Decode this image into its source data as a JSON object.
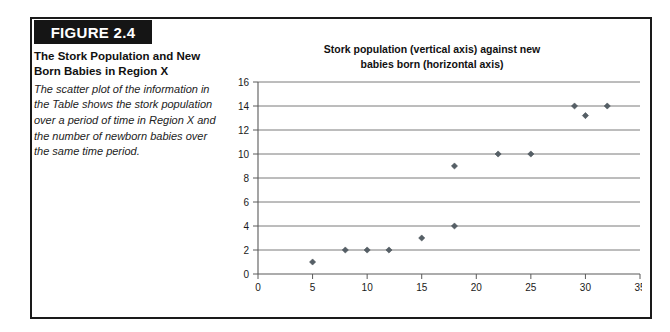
{
  "figure": {
    "badge_label": "FIGURE 2.4",
    "caption_title": "The Stork Population and New Born Babies in Region X",
    "caption_body": "The scatter plot of the information in the Table shows the stork population over a period of time in Region X and the number of newborn babies over the same time period."
  },
  "colors": {
    "frame": "#1a1a1a",
    "badge_bg": "#151515",
    "badge_text": "#ffffff",
    "marker": "#555f66",
    "gridline": "#6b6b6b",
    "axis": "#5a5a5a"
  },
  "chart_data": {
    "type": "scatter",
    "title": "Stork population (vertical axis) against new babies born (horizontal axis)",
    "title_line_1": "Stork population (vertical axis) against new",
    "title_line_2": "babies born (horizontal axis)",
    "xlabel": "",
    "ylabel": "",
    "xlim": [
      0,
      35
    ],
    "ylim": [
      0,
      16
    ],
    "xticks": [
      0,
      5,
      10,
      15,
      20,
      25,
      30,
      35
    ],
    "yticks": [
      0,
      2,
      4,
      6,
      8,
      10,
      12,
      14,
      16
    ],
    "grid": "horizontal",
    "legend": "none",
    "series": [
      {
        "name": "Stork population vs new babies born",
        "points": [
          {
            "x": 5,
            "y": 1
          },
          {
            "x": 8,
            "y": 2
          },
          {
            "x": 10,
            "y": 2
          },
          {
            "x": 12,
            "y": 2
          },
          {
            "x": 15,
            "y": 3
          },
          {
            "x": 18,
            "y": 4
          },
          {
            "x": 18,
            "y": 9
          },
          {
            "x": 22,
            "y": 10
          },
          {
            "x": 25,
            "y": 10
          },
          {
            "x": 29,
            "y": 14
          },
          {
            "x": 30,
            "y": 13.2
          },
          {
            "x": 32,
            "y": 14
          }
        ]
      }
    ]
  }
}
